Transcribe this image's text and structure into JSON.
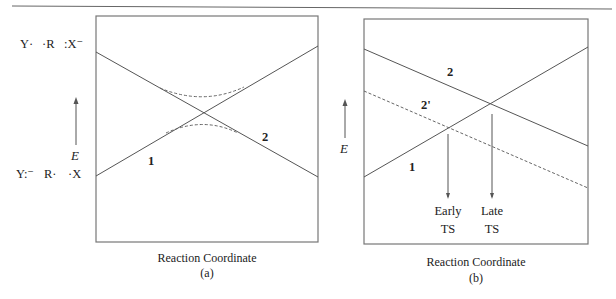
{
  "header_rule": true,
  "panel_a": {
    "species_top": {
      "y": "Y·",
      "r": "·R",
      "x": ":X⁻"
    },
    "species_bottom": {
      "y": "Y:⁻",
      "r": "R·",
      "x": "·X"
    },
    "axis_label": "E",
    "curve_labels": {
      "one": "1",
      "two": "2"
    },
    "xlabel": "Reaction Coordinate",
    "caption": "(a)"
  },
  "panel_b": {
    "axis_label": "E",
    "curve_labels": {
      "one": "1",
      "two": "2",
      "two_prime": "2'"
    },
    "ts_labels": {
      "early_1": "Early",
      "early_2": "TS",
      "late_1": "Late",
      "late_2": "TS"
    },
    "xlabel": "Reaction Coordinate",
    "caption": "(b)"
  },
  "colors": {
    "line": "#555555",
    "dashed": "#666666",
    "frame": "#777777",
    "text": "#222222"
  }
}
